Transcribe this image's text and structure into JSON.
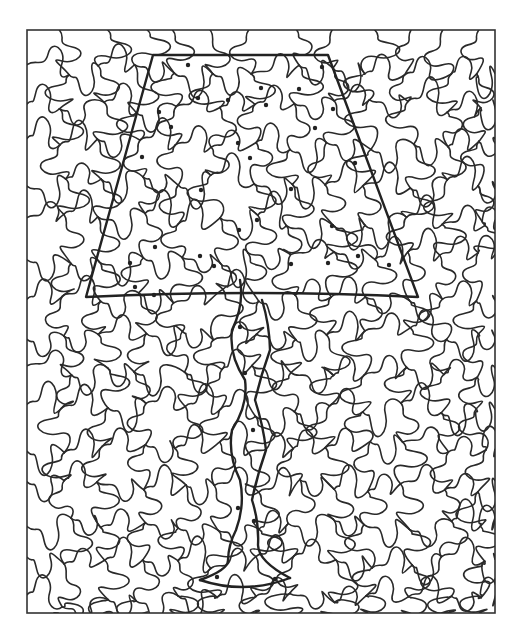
{
  "puzzle": {
    "title": "Hidden picture: lamp",
    "subject": "table-lamp",
    "frame": {
      "x": 27,
      "y": 30,
      "width": 468,
      "height": 583
    },
    "colors": {
      "line": "#2a2a2a",
      "background": "#ffffff",
      "dot": "#222222"
    },
    "lamp": {
      "shade": [
        [
          153,
          55
        ],
        [
          328,
          55
        ],
        [
          418,
          297
        ],
        [
          86,
          297
        ]
      ],
      "stem_left": [
        [
          240,
          280
        ],
        [
          232,
          330
        ],
        [
          245,
          380
        ],
        [
          232,
          430
        ],
        [
          240,
          480
        ],
        [
          236,
          530
        ],
        [
          228,
          560
        ],
        [
          200,
          580
        ]
      ],
      "stem_right": [
        [
          262,
          300
        ],
        [
          270,
          350
        ],
        [
          255,
          400
        ],
        [
          266,
          450
        ],
        [
          252,
          500
        ],
        [
          258,
          545
        ],
        [
          290,
          578
        ]
      ],
      "base_curve": [
        [
          200,
          580
        ],
        [
          245,
          595
        ],
        [
          290,
          578
        ]
      ]
    },
    "dots": [
      [
        188,
        65
      ],
      [
        322,
        67
      ],
      [
        261,
        88
      ],
      [
        299,
        89
      ],
      [
        198,
        98
      ],
      [
        228,
        100
      ],
      [
        266,
        105
      ],
      [
        159,
        112
      ],
      [
        333,
        109
      ],
      [
        171,
        127
      ],
      [
        315,
        128
      ],
      [
        238,
        143
      ],
      [
        250,
        158
      ],
      [
        142,
        157
      ],
      [
        355,
        163
      ],
      [
        201,
        190
      ],
      [
        291,
        189
      ],
      [
        257,
        220
      ],
      [
        239,
        230
      ],
      [
        332,
        226
      ],
      [
        155,
        247
      ],
      [
        200,
        256
      ],
      [
        130,
        263
      ],
      [
        214,
        266
      ],
      [
        291,
        264
      ],
      [
        358,
        256
      ],
      [
        328,
        263
      ],
      [
        389,
        265
      ],
      [
        135,
        287
      ],
      [
        154,
        295
      ],
      [
        240,
        327
      ],
      [
        245,
        373
      ],
      [
        253,
        430
      ],
      [
        238,
        508
      ],
      [
        254,
        521
      ],
      [
        217,
        577
      ],
      [
        275,
        579
      ]
    ]
  }
}
